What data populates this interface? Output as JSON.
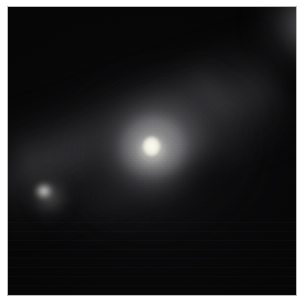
{
  "figure": {
    "kind": "astronomical-image",
    "colorscale": "greyscale",
    "background_color": "#050505",
    "frame_border_color": "#b9b9b9",
    "page_background": "#ffffff",
    "overlay_text": "",
    "labels": [],
    "tick_labels": [],
    "scale_bar": "",
    "compass": ""
  },
  "objects": [
    {
      "name": "nucleus",
      "role": "bright unresolved stellar nucleus",
      "center_px": [
        152,
        152
      ],
      "size_px": [
        12,
        14
      ],
      "peak_color": "#fbfbf2",
      "relative_brightness": 1.0
    },
    {
      "name": "inner-disk",
      "role": "smooth bright inner disk / nuclear ring",
      "center_px": [
        152,
        152
      ],
      "size_px": [
        84,
        78
      ],
      "peak_color": "#969695",
      "relative_brightness": 0.58
    },
    {
      "name": "outer-envelope",
      "role": "diffuse elongated stellar envelope",
      "center_px": [
        152,
        148
      ],
      "size_px": [
        156,
        144
      ],
      "peak_color": "#767678",
      "relative_brightness": 0.44
    },
    {
      "name": "companion",
      "role": "compact companion source",
      "center_px": [
        40,
        200
      ],
      "size_px": [
        14,
        13
      ],
      "peak_color": "#d6d6d2",
      "relative_brightness": 0.82
    },
    {
      "name": "background-glow",
      "role": "broad diffuse emission in upper-right corner",
      "center_px": [
        292,
        16
      ],
      "size_px": [
        200,
        180
      ],
      "peak_color": "#8e8e90",
      "relative_brightness": 0.56
    },
    {
      "name": "tidal-streak",
      "role": "faint diagonal filament from lower-left to upper-right",
      "center_px": [
        110,
        150
      ],
      "size_px": [
        300,
        120
      ],
      "peak_color": "#424245",
      "relative_brightness": 0.26
    },
    {
      "name": "southwest-plume",
      "role": "faint plume extending to the lower left",
      "center_px": [
        90,
        220
      ],
      "size_px": [
        170,
        105
      ],
      "peak_color": "#303033",
      "relative_brightness": 0.17
    },
    {
      "name": "east-extension",
      "role": "faint extension toward the right of the galaxy",
      "center_px": [
        235,
        135
      ],
      "size_px": [
        120,
        100
      ],
      "peak_color": "#2c2c2f",
      "relative_brightness": 0.16
    }
  ]
}
